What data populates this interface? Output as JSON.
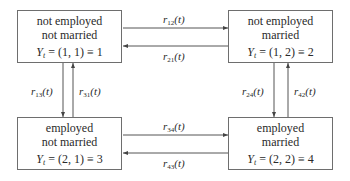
{
  "diagram": {
    "type": "state-transition",
    "states": [
      {
        "id": 1,
        "line1": "not employed",
        "line2": "not married",
        "var": "Y",
        "sub": "t",
        "tuple": "(1, 1)",
        "index": "1"
      },
      {
        "id": 2,
        "line1": "not employed",
        "line2": "married",
        "var": "Y",
        "sub": "t",
        "tuple": "(1, 2)",
        "index": "2"
      },
      {
        "id": 3,
        "line1": "employed",
        "line2": "not married",
        "var": "Y",
        "sub": "t",
        "tuple": "(2, 1)",
        "index": "3"
      },
      {
        "id": 4,
        "line1": "employed",
        "line2": "married",
        "var": "Y",
        "sub": "t",
        "tuple": "(2, 2)",
        "index": "4"
      }
    ],
    "transitions": [
      {
        "from": 1,
        "to": 2,
        "r": "r",
        "sub": "12",
        "arg": "(t)"
      },
      {
        "from": 2,
        "to": 1,
        "r": "r",
        "sub": "21",
        "arg": "(t)"
      },
      {
        "from": 1,
        "to": 3,
        "r": "r",
        "sub": "13",
        "arg": "(t)"
      },
      {
        "from": 3,
        "to": 1,
        "r": "r",
        "sub": "31",
        "arg": "(t)"
      },
      {
        "from": 2,
        "to": 4,
        "r": "r",
        "sub": "24",
        "arg": "(t)"
      },
      {
        "from": 4,
        "to": 2,
        "r": "r",
        "sub": "42",
        "arg": "(t)"
      },
      {
        "from": 3,
        "to": 4,
        "r": "r",
        "sub": "34",
        "arg": "(t)"
      },
      {
        "from": 4,
        "to": 3,
        "r": "r",
        "sub": "43",
        "arg": "(t)"
      }
    ],
    "symbols": {
      "equals": " = ",
      "equiv": " ≡ "
    },
    "colors": {
      "line": "#555555",
      "text": "#2a2a2a",
      "border": "#6e6e6e"
    }
  }
}
